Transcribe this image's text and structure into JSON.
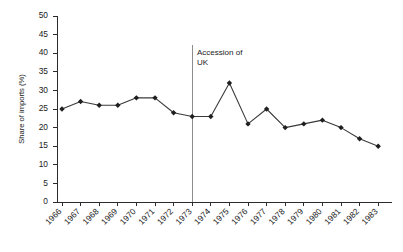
{
  "chart_data": {
    "type": "line",
    "title": "",
    "xlabel": "",
    "ylabel": "Share of imports (%)",
    "ylim": [
      0,
      50
    ],
    "ytick_step": 5,
    "yticks": [
      0,
      5,
      10,
      15,
      20,
      25,
      30,
      35,
      40,
      45,
      50
    ],
    "grid": false,
    "legend": "none",
    "marker": "diamond",
    "line_color": "#3a3a3a",
    "marker_color": "#1f1f1f",
    "categories": [
      "1966",
      "1967",
      "1968",
      "1969",
      "1970",
      "1971",
      "1972",
      "1973",
      "1974",
      "1975",
      "1976",
      "1977",
      "1978",
      "1979",
      "1980",
      "1981",
      "1982",
      "1983"
    ],
    "values": [
      25,
      27,
      26,
      26,
      28,
      28,
      24,
      23,
      23,
      32,
      21,
      25,
      20,
      21,
      22,
      20,
      17,
      15
    ],
    "annotations": [
      {
        "type": "vertical-line",
        "label_line1": "Accession of",
        "label_line2": "UK",
        "between": [
          "1973",
          "1974"
        ],
        "color": "#8c8c8c"
      }
    ]
  }
}
